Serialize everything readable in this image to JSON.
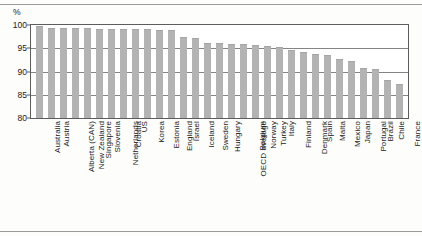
{
  "axis": {
    "y_unit": "%",
    "y_ticks": [
      100,
      95,
      90,
      85,
      80
    ]
  },
  "chart_data": {
    "type": "bar",
    "title": "",
    "xlabel": "",
    "ylabel": "%",
    "ylim": [
      80,
      100
    ],
    "grid": true,
    "legend": "none",
    "orientation": "vertical",
    "bar_color": "#b3b3b3",
    "categories": [
      "Australia",
      "Austria",
      "Alberta (CAN)",
      "New Zealand",
      "Singapore",
      "Slovenia",
      "Netherlands",
      "Croatia",
      "US",
      "Korea",
      "Estonia",
      "England",
      "Israel",
      "Iceland",
      "Sweden",
      "Hungary",
      "OECD average",
      "Belgium",
      "Norway",
      "Turkey",
      "Italy",
      "Finland",
      "Denmark",
      "Spain",
      "Malta",
      "Mexico",
      "Japan",
      "Portugal",
      "Brazil",
      "Chile",
      "France"
    ],
    "values": [
      99.8,
      99.4,
      99.4,
      99.3,
      99.3,
      99.2,
      99.2,
      99.2,
      99.2,
      99.1,
      98.9,
      99.0,
      97.4,
      97.2,
      96.2,
      96.1,
      96.0,
      95.9,
      95.8,
      95.5,
      95.2,
      94.6,
      94.3,
      93.8,
      93.6,
      92.6,
      92.2,
      90.8,
      90.6,
      88.2,
      87.3
    ]
  }
}
